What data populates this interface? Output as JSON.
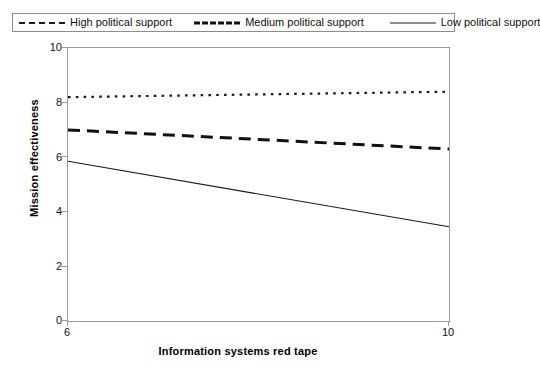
{
  "legend": {
    "entries": [
      {
        "label": "High political support",
        "style": "dotted",
        "swatch_icon": "dotted-line-icon"
      },
      {
        "label": "Medium political support",
        "style": "dashed",
        "swatch_icon": "dashed-line-icon"
      },
      {
        "label": "Low political support",
        "style": "solid",
        "swatch_icon": "solid-line-icon"
      }
    ]
  },
  "axes": {
    "y_ticks": [
      "0",
      "2",
      "4",
      "6",
      "8",
      "10"
    ],
    "x_ticks": [
      "6",
      "10"
    ],
    "y_title": "Mission effectiveness",
    "x_title": "Information systems red tape"
  },
  "chart_data": {
    "type": "line",
    "title": "",
    "xlabel": "Information systems red tape",
    "ylabel": "Mission effectiveness",
    "xlim": [
      6,
      10
    ],
    "ylim": [
      0,
      10
    ],
    "xticks": [
      6,
      10
    ],
    "yticks": [
      0,
      2,
      4,
      6,
      8,
      10
    ],
    "grid": false,
    "legend_position": "top",
    "x": [
      6,
      10
    ],
    "series": [
      {
        "name": "High political support",
        "style": "dotted",
        "color": "#1a1a1a",
        "values": [
          8.2,
          8.4
        ]
      },
      {
        "name": "Medium political support",
        "style": "dashed",
        "color": "#111111",
        "values": [
          7.0,
          6.3
        ]
      },
      {
        "name": "Low political support",
        "style": "solid",
        "color": "#1a1a1a",
        "values": [
          5.85,
          3.45
        ]
      }
    ]
  }
}
